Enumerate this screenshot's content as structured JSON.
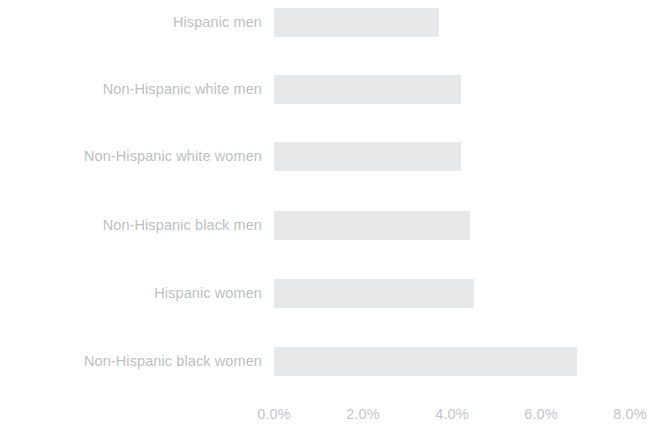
{
  "chart_data": {
    "type": "bar",
    "orientation": "horizontal",
    "title": "",
    "subtitle": "",
    "xlabel": "",
    "ylabel": "",
    "categories": [
      "Hispanic men",
      "Non-Hispanic white men",
      "Non-Hispanic white women",
      "Non-Hispanic black men",
      "Hispanic women",
      "Non-Hispanic black women"
    ],
    "values": [
      3.7,
      4.2,
      4.2,
      4.4,
      4.5,
      6.8
    ],
    "value_unit": "%",
    "xlim": [
      0.0,
      8.0
    ],
    "xticks": [
      0.0,
      2.0,
      4.0,
      6.0,
      8.0
    ],
    "xtick_labels": [
      "0.0%",
      "2.0%",
      "4.0%",
      "6.0%",
      "8.0%"
    ],
    "grid": false,
    "legend": false,
    "legend_position": "none",
    "bar_color": "#e7e8ea",
    "label_color": "#bcbfc1",
    "tick_color": "#c3c6c8",
    "background_color": "#ffffff"
  }
}
